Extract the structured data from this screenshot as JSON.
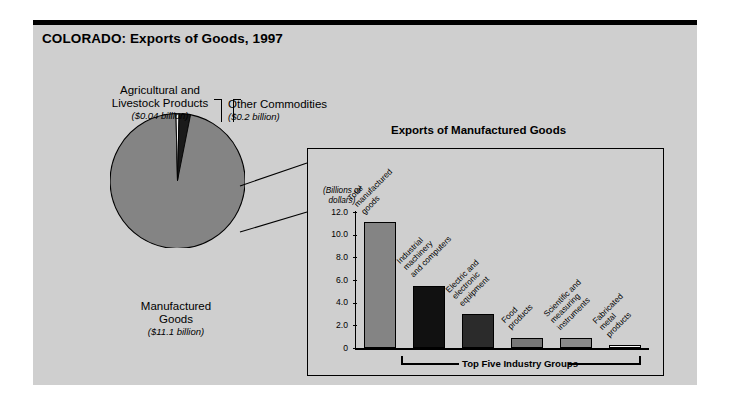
{
  "figure": {
    "title": "COLORADO: Exports of Goods, 1997"
  },
  "pie": {
    "slices": [
      {
        "label_line1": "Manufactured",
        "label_line2": "Goods",
        "amount": "($11.1 billion)",
        "value": 11.1,
        "color": "#848484"
      },
      {
        "label_line1": "Other Commodities",
        "label_line2": "",
        "amount": "($0.2 billion)",
        "value": 0.2,
        "color": "#1a1a1a"
      },
      {
        "label_line1": "Agricultural and",
        "label_line2": "Livestock Products",
        "amount": "($0.04 billion)",
        "value": 0.04,
        "color": "#f2f2f2"
      }
    ]
  },
  "inset": {
    "title": "Exports of Manufactured Goods",
    "axis_units_line1": "(Billions of",
    "axis_units_line2": "dollars)",
    "bracket_label": "Top Five Industry Groups"
  },
  "chart_data": {
    "type": "bar",
    "title": "Exports of Manufactured Goods",
    "xlabel": "Top Five Industry Groups",
    "ylabel": "(Billions of dollars)",
    "ylim": [
      0,
      12.0
    ],
    "yticks": [
      "0",
      "2.0",
      "4.0",
      "6.0",
      "8.0",
      "10.0",
      "12.0"
    ],
    "ytick_values": [
      0,
      2.0,
      4.0,
      6.0,
      8.0,
      10.0,
      12.0
    ],
    "grid": false,
    "legend": "none",
    "categories": [
      "Total manufactured goods",
      "Industrial machinery and computers",
      "Electric and electronic equipment",
      "Food products",
      "Scientific and measuring instruments",
      "Fabricated metal products"
    ],
    "category_lines": [
      [
        "Total",
        "manufactured",
        "goods"
      ],
      [
        "Industrial",
        "machinery",
        "and computers"
      ],
      [
        "Electric and",
        "electronic",
        "equipment"
      ],
      [
        "Food",
        "products"
      ],
      [
        "Scientific and",
        "measuring",
        "instruments"
      ],
      [
        "Fabricated",
        "metal",
        "products"
      ]
    ],
    "values": [
      11.1,
      5.5,
      3.0,
      0.9,
      0.85,
      0.2
    ],
    "bar_colors": [
      "#848484",
      "#111111",
      "#2b2b2b",
      "#777777",
      "#8a8a8a",
      "#fbfbfb"
    ]
  },
  "pie_chart_data": {
    "type": "pie",
    "title": "COLORADO: Exports of Goods, 1997",
    "labels": [
      "Manufactured Goods",
      "Other Commodities",
      "Agricultural and Livestock Products"
    ],
    "values": [
      11.1,
      0.2,
      0.04
    ],
    "value_labels": [
      "($11.1 billion)",
      "($0.2 billion)",
      "($0.04 billion)"
    ],
    "colors": [
      "#848484",
      "#1a1a1a",
      "#f2f2f2"
    ]
  },
  "colors": {
    "panel_background": "#cfcfcf",
    "page_background": "#ffffff",
    "outline": "#000000",
    "pie_main": "#848484",
    "pie_other": "#1a1a1a",
    "pie_agri": "#f2f2f2"
  }
}
